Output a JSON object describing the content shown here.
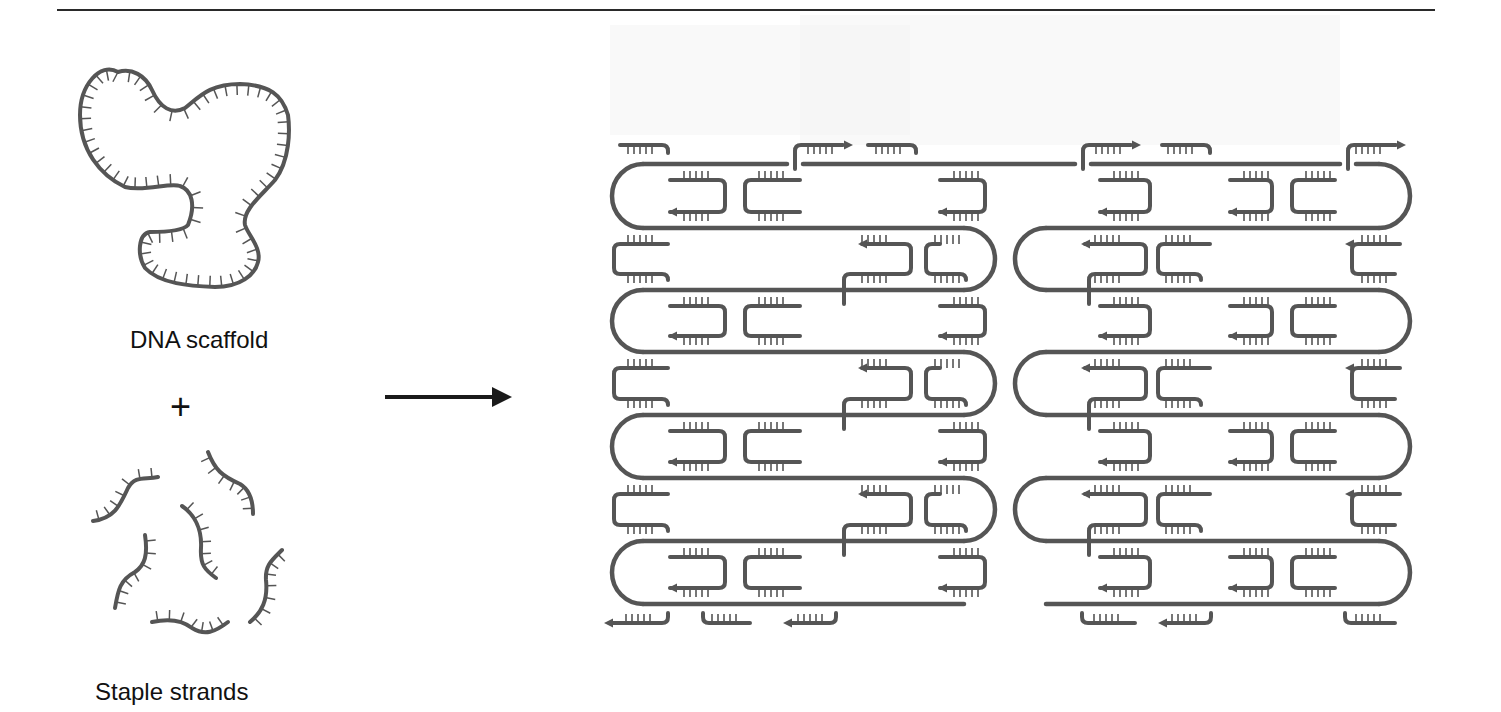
{
  "figure": {
    "labels": {
      "scaffold": "DNA scaffold",
      "plus": "+",
      "staples": "Staple strands"
    },
    "colors": {
      "strand": "#555555",
      "text": "#111111",
      "arrow": "#1a1a1a",
      "rule": "#2a2a2a",
      "background_bleed": "#f2f2f2"
    },
    "arrow": {
      "x1": 385,
      "x2": 512,
      "y": 397
    },
    "origami": {
      "scaffold_rows_y": [
        164,
        228,
        290,
        352,
        415,
        478,
        541,
        604
      ],
      "left_block": {
        "x_left": 612,
        "x_right": 995
      },
      "right_block": {
        "x_left": 1015,
        "x_right": 1410
      },
      "crossovers_x": [
        795,
        1083,
        1348
      ],
      "description": "DNA origami: scaffold folded by staple strands into rows of parallel helices"
    }
  }
}
